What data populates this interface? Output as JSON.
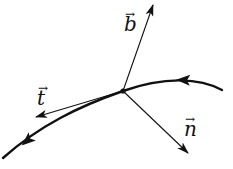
{
  "diagram": {
    "colors": {
      "stroke": "#111111",
      "background": "#ffffff"
    },
    "point": {
      "x": 123,
      "y": 91
    },
    "curve": {
      "path": "M 222 90 C 200 78, 165 76, 123 91 C 80 106, 40 125, 3 158",
      "direction_arrows": [
        {
          "x": 183,
          "y": 81,
          "angle": 180
        },
        {
          "x": 27,
          "y": 140,
          "angle": 140
        }
      ]
    },
    "vectors": [
      {
        "name": "binormal",
        "label": "b",
        "x2": 153,
        "y2": 5
      },
      {
        "name": "normal",
        "label": "n",
        "x2": 188,
        "y2": 153
      },
      {
        "name": "tangent",
        "label": "t",
        "x2": 36,
        "y2": 117
      }
    ],
    "labels": {
      "b": "b",
      "t": "t",
      "n": "n",
      "arrow_glyph": "→"
    }
  }
}
